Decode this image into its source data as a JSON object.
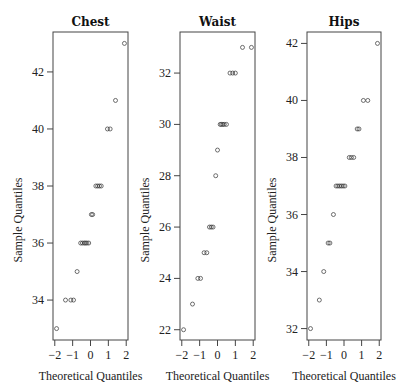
{
  "chart_data": [
    {
      "type": "scatter",
      "title": "Chest",
      "xlabel": "Theoretical Quantiles",
      "ylabel": "Sample Quantiles",
      "xlim": [
        -2.1,
        2.1
      ],
      "ylim": [
        32.6,
        43.4
      ],
      "xticks": [
        -2,
        -1,
        0,
        1,
        2
      ],
      "yticks": [
        34,
        36,
        38,
        40,
        42
      ],
      "grid": false,
      "points": [
        {
          "x": -1.9,
          "y": 33
        },
        {
          "x": -1.4,
          "y": 34
        },
        {
          "x": -1.1,
          "y": 34
        },
        {
          "x": -0.95,
          "y": 34
        },
        {
          "x": -0.75,
          "y": 35
        },
        {
          "x": -0.55,
          "y": 36
        },
        {
          "x": -0.45,
          "y": 36
        },
        {
          "x": -0.35,
          "y": 36
        },
        {
          "x": -0.28,
          "y": 36
        },
        {
          "x": -0.2,
          "y": 36
        },
        {
          "x": -0.1,
          "y": 36
        },
        {
          "x": 0.05,
          "y": 37
        },
        {
          "x": 0.12,
          "y": 37
        },
        {
          "x": 0.3,
          "y": 38
        },
        {
          "x": 0.4,
          "y": 38
        },
        {
          "x": 0.5,
          "y": 38
        },
        {
          "x": 0.6,
          "y": 38
        },
        {
          "x": 0.95,
          "y": 40
        },
        {
          "x": 1.1,
          "y": 40
        },
        {
          "x": 1.4,
          "y": 41
        },
        {
          "x": 1.9,
          "y": 43
        }
      ]
    },
    {
      "type": "scatter",
      "title": "Waist",
      "xlabel": "Theoretical Quantiles",
      "ylabel": "Sample Quantiles",
      "xlim": [
        -2.1,
        2.1
      ],
      "ylim": [
        21.6,
        33.6
      ],
      "xticks": [
        -2,
        -1,
        0,
        1,
        2
      ],
      "yticks": [
        22,
        24,
        26,
        28,
        30,
        32
      ],
      "grid": false,
      "points": [
        {
          "x": -1.9,
          "y": 22
        },
        {
          "x": -1.4,
          "y": 23
        },
        {
          "x": -1.1,
          "y": 24
        },
        {
          "x": -0.95,
          "y": 24
        },
        {
          "x": -0.75,
          "y": 25
        },
        {
          "x": -0.6,
          "y": 25
        },
        {
          "x": -0.45,
          "y": 26
        },
        {
          "x": -0.35,
          "y": 26
        },
        {
          "x": -0.25,
          "y": 26
        },
        {
          "x": -0.1,
          "y": 28
        },
        {
          "x": 0.0,
          "y": 29
        },
        {
          "x": 0.15,
          "y": 30
        },
        {
          "x": 0.22,
          "y": 30
        },
        {
          "x": 0.3,
          "y": 30
        },
        {
          "x": 0.38,
          "y": 30
        },
        {
          "x": 0.5,
          "y": 30
        },
        {
          "x": 0.7,
          "y": 32
        },
        {
          "x": 0.85,
          "y": 32
        },
        {
          "x": 1.0,
          "y": 32
        },
        {
          "x": 1.4,
          "y": 33
        },
        {
          "x": 1.9,
          "y": 33
        }
      ]
    },
    {
      "type": "scatter",
      "title": "Hips",
      "xlabel": "Theoretical Quantiles",
      "ylabel": "Sample Quantiles",
      "xlim": [
        -2.1,
        2.1
      ],
      "ylim": [
        31.6,
        42.4
      ],
      "xticks": [
        -2,
        -1,
        0,
        1,
        2
      ],
      "yticks": [
        32,
        34,
        36,
        38,
        40,
        42
      ],
      "grid": false,
      "points": [
        {
          "x": -1.9,
          "y": 32
        },
        {
          "x": -1.4,
          "y": 33
        },
        {
          "x": -1.15,
          "y": 34
        },
        {
          "x": -0.9,
          "y": 35
        },
        {
          "x": -0.8,
          "y": 35
        },
        {
          "x": -0.6,
          "y": 36
        },
        {
          "x": -0.45,
          "y": 37
        },
        {
          "x": -0.35,
          "y": 37
        },
        {
          "x": -0.25,
          "y": 37
        },
        {
          "x": -0.15,
          "y": 37
        },
        {
          "x": -0.05,
          "y": 37
        },
        {
          "x": 0.05,
          "y": 37
        },
        {
          "x": 0.3,
          "y": 38
        },
        {
          "x": 0.42,
          "y": 38
        },
        {
          "x": 0.55,
          "y": 38
        },
        {
          "x": 0.75,
          "y": 39
        },
        {
          "x": 0.85,
          "y": 39
        },
        {
          "x": 1.1,
          "y": 40
        },
        {
          "x": 1.35,
          "y": 40
        },
        {
          "x": 1.9,
          "y": 42
        }
      ]
    }
  ],
  "layout": {
    "panels": [
      {
        "x0": 53,
        "x1": 128
      },
      {
        "x0": 180,
        "x1": 255
      },
      {
        "x0": 307,
        "x1": 381
      }
    ],
    "y0": 32,
    "y1": 340
  }
}
